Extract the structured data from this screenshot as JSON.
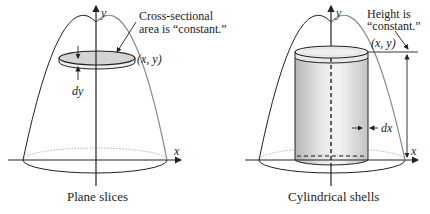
{
  "left_figure": {
    "caption": "Plane slices",
    "annotation_line1": "Cross-sectional",
    "annotation_line2": "area is “constant.”",
    "point_label": "(x, y)",
    "differential_label": "dy",
    "y_axis_label": "y",
    "x_axis_label": "x"
  },
  "right_figure": {
    "caption": "Cylindrical shells",
    "annotation_line1": "Height is",
    "annotation_line2": "“constant.”",
    "point_label": "(x, y)",
    "differential_label": "dx",
    "y_axis_label": "y",
    "x_axis_label": "x"
  },
  "colors": {
    "stroke": "#222222",
    "parabola_right_side": "#888888",
    "disk_fill": "#d4d4d4",
    "shell_fill_dark": "#bdbdbd",
    "shell_fill_light": "#f2f2f2",
    "dotted_ellipse": "#999999"
  }
}
